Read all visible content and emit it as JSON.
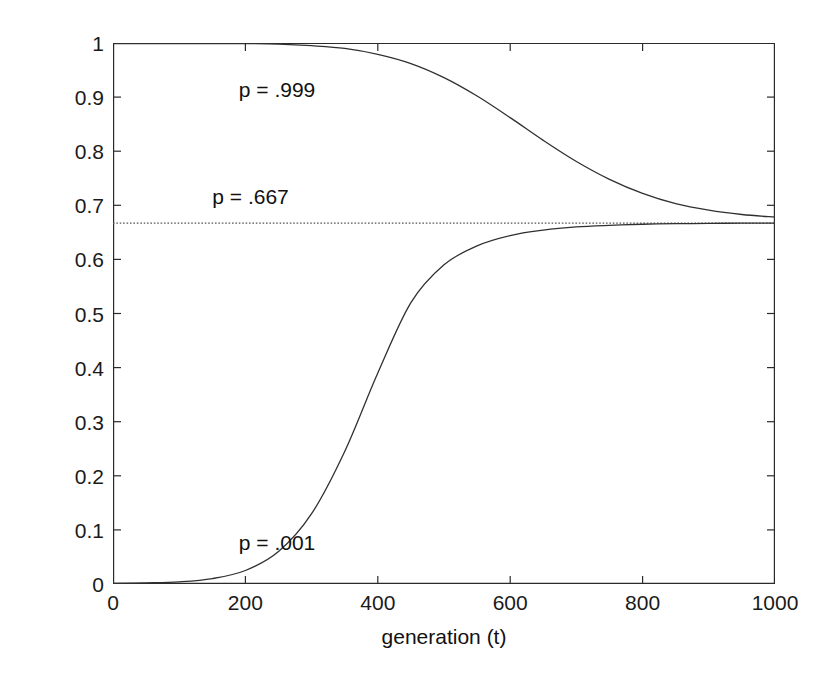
{
  "chart_data": {
    "type": "line",
    "title": "",
    "subtitle": "",
    "xlabel": "generation (t)",
    "ylabel": "relative frequency (p)",
    "xlim": [
      0,
      1000
    ],
    "ylim": [
      0,
      1
    ],
    "grid": false,
    "legend_position": "none",
    "x_ticks": [
      0,
      200,
      400,
      600,
      800,
      1000
    ],
    "x_tick_labels": [
      "0",
      "200",
      "400",
      "600",
      "800",
      "1000"
    ],
    "y_ticks": [
      0,
      0.1,
      0.2,
      0.3,
      0.4,
      0.5,
      0.6,
      0.7,
      0.8,
      0.9,
      1
    ],
    "y_tick_labels": [
      "0",
      "0.1",
      "0.2",
      "0.3",
      "0.4",
      "0.5",
      "0.6",
      "0.7",
      "0.8",
      "0.9",
      "1"
    ],
    "x": [
      0,
      50,
      100,
      150,
      200,
      250,
      300,
      350,
      400,
      450,
      500,
      550,
      600,
      650,
      700,
      750,
      800,
      850,
      900,
      950,
      1000
    ],
    "series": [
      {
        "name": "p = .999",
        "color": "#303030",
        "style": "solid",
        "start_value": 0.999,
        "values": [
          0.999,
          0.999,
          0.999,
          0.999,
          0.999,
          0.998,
          0.995,
          0.99,
          0.979,
          0.962,
          0.936,
          0.902,
          0.862,
          0.82,
          0.781,
          0.748,
          0.722,
          0.703,
          0.691,
          0.683,
          0.678
        ]
      },
      {
        "name": "p = .667",
        "color": "#555555",
        "style": "dotted",
        "equilibrium_value": 0.667,
        "values": [
          0.667,
          0.667,
          0.667,
          0.667,
          0.667,
          0.667,
          0.667,
          0.667,
          0.667,
          0.667,
          0.667,
          0.667,
          0.667,
          0.667,
          0.667,
          0.667,
          0.667,
          0.667,
          0.667,
          0.667,
          0.667
        ]
      },
      {
        "name": "p = .001",
        "color": "#303030",
        "style": "solid",
        "start_value": 0.001,
        "values": [
          0.001,
          0.002,
          0.004,
          0.01,
          0.025,
          0.06,
          0.13,
          0.245,
          0.39,
          0.52,
          0.59,
          0.625,
          0.644,
          0.654,
          0.66,
          0.663,
          0.665,
          0.666,
          0.6665,
          0.667,
          0.667
        ]
      }
    ],
    "annotations": [
      {
        "text": "p = .999",
        "x": 190,
        "y": 0.915
      },
      {
        "text": "p = .667",
        "x": 150,
        "y": 0.718
      },
      {
        "text": "p = .001",
        "x": 190,
        "y": 0.078
      }
    ]
  },
  "axes": {
    "x_title": "generation (t)",
    "y_title": "relative frequency (p)"
  }
}
